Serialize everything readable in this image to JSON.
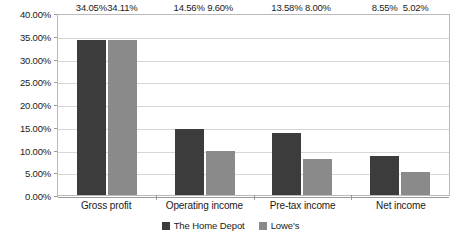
{
  "chart_data": {
    "type": "bar",
    "title": "",
    "subtitle": "",
    "xlabel": "",
    "ylabel": "",
    "categories": [
      "Gross profit",
      "Operating income",
      "Pre-tax income",
      "Net income"
    ],
    "series": [
      {
        "name": "The Home Depot",
        "color": "#3c3c3c",
        "values": [
          34.05,
          14.56,
          13.58,
          8.55
        ],
        "labels": [
          "34.05%",
          "14.56%",
          "13.58%",
          "8.55%"
        ]
      },
      {
        "name": "Lowe's",
        "color": "#8a8a8a",
        "values": [
          34.11,
          9.6,
          8.0,
          5.02
        ],
        "labels": [
          "34.11%",
          "9.60%",
          "8.00%",
          "5.02%"
        ]
      }
    ],
    "ylim": [
      0,
      40
    ],
    "ytick_step": 5,
    "ytick_labels": [
      "40.00%",
      "35.00%",
      "30.00%",
      "25.00%",
      "20.00%",
      "15.00%",
      "10.00%",
      "5.00%",
      "0.00%"
    ],
    "ytick_values": [
      40,
      35,
      30,
      25,
      20,
      15,
      10,
      5,
      0
    ],
    "grid": true,
    "legend_position": "bottom",
    "value_suffix": "%"
  }
}
